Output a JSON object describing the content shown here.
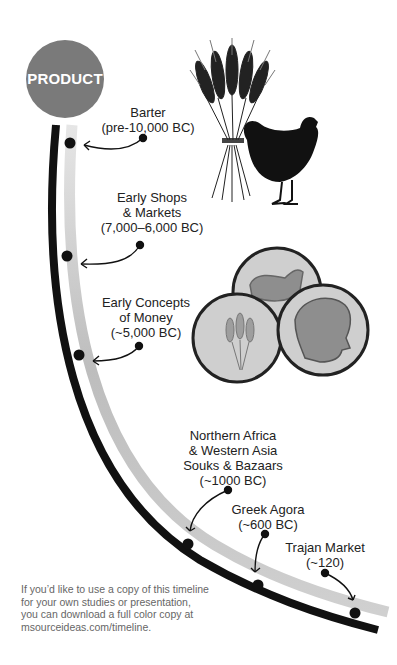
{
  "header": {
    "node_label": "PRODUCT",
    "node_color": "#7a7a7a"
  },
  "events": [
    {
      "name": "Barter",
      "date": "(pre-10,000 BC)"
    },
    {
      "name_line1": "Early Shops",
      "name_line2": "& Markets",
      "date": "(7,000–6,000 BC)"
    },
    {
      "name_line1": "Early Concepts",
      "name_line2": "of Money",
      "date": "(~5,000 BC)"
    },
    {
      "name_line1": "Northern Africa",
      "name_line2": "& Western Asia",
      "name_line3": "Souks & Bazaars",
      "date": "(~1000 BC)"
    },
    {
      "name": "Greek Agora",
      "date": "(~600 BC)"
    },
    {
      "name": "Trajan Market",
      "date": "(~120)"
    }
  ],
  "illustrations": [
    "wheat-sheaf-icon",
    "chicken-icon",
    "coins-icon"
  ],
  "footnote": {
    "line1": "If you’d like to use a copy of this timeline",
    "line2": "for your own studies or presentation,",
    "line3": "you can download a full color copy at",
    "line4": "msourceideas.com/timeline."
  },
  "colors": {
    "timeline_dark": "#111111",
    "timeline_light": "#c8c8c8",
    "text": "#222222"
  }
}
